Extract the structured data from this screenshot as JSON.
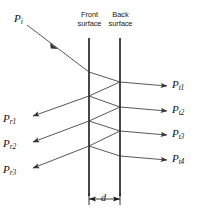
{
  "figure": {
    "surfaces": {
      "front": {
        "label": "Front\nsurface",
        "x": 89,
        "y_top": 38,
        "y_bottom": 196
      },
      "back": {
        "label": "Back\nsurface",
        "x": 120,
        "y_top": 38,
        "y_bottom": 196
      }
    },
    "incident": {
      "label": "P",
      "sub": "i",
      "x": 14,
      "y": 18
    },
    "reflected": [
      {
        "label": "P",
        "sub": "r1",
        "x": 3,
        "y": 118
      },
      {
        "label": "P",
        "sub": "r2",
        "x": 3,
        "y": 143
      },
      {
        "label": "P",
        "sub": "r3",
        "x": 3,
        "y": 169
      }
    ],
    "transmitted": [
      {
        "label": "P",
        "sub": "t1",
        "x": 172,
        "y": 83
      },
      {
        "label": "P",
        "sub": "t2",
        "x": 172,
        "y": 108
      },
      {
        "label": "P",
        "sub": "t3",
        "x": 172,
        "y": 132
      },
      {
        "label": "P",
        "sub": "t4",
        "x": 172,
        "y": 157
      }
    ],
    "thickness": {
      "label": "d",
      "x": 101,
      "y": 196
    },
    "colors": {
      "line": "#1a1a1a",
      "ray": "#444444",
      "background": "#ffffff",
      "text": "#111111"
    }
  }
}
